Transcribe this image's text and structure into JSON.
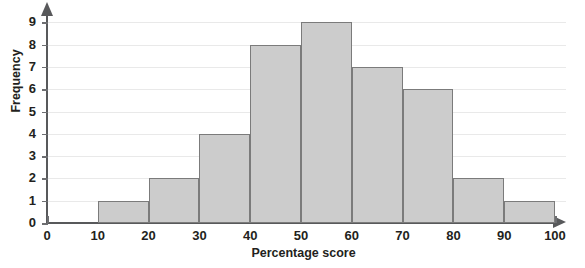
{
  "chart_data": {
    "type": "bar",
    "title": "",
    "subtitle": "",
    "xlabel": "Percentage score",
    "ylabel": "Frequency",
    "categories": [
      "10–20",
      "20–30",
      "30–40",
      "40–50",
      "50–60",
      "60–70",
      "70–80",
      "80–90",
      "90–100"
    ],
    "bin_edges": [
      10,
      20,
      30,
      40,
      50,
      60,
      70,
      80,
      90,
      100
    ],
    "values": [
      1,
      2,
      4,
      8,
      9,
      7,
      6,
      2,
      1
    ],
    "xlim": [
      0,
      100
    ],
    "ylim": [
      0,
      9
    ],
    "x_ticks": [
      "0",
      "10",
      "20",
      "30",
      "40",
      "50",
      "60",
      "70",
      "80",
      "90",
      "100"
    ],
    "y_ticks": [
      "0",
      "1",
      "2",
      "3",
      "4",
      "5",
      "6",
      "7",
      "8",
      "9"
    ],
    "grid": true,
    "legend": false,
    "legend_position": "none",
    "bar_fill_color": "#cccccc",
    "bar_border_color": "#7b7b7b",
    "axis_color": "#58595b",
    "grid_color": "#e9e9e9",
    "background_color": "#ffffff",
    "text_color": "#231f20"
  }
}
